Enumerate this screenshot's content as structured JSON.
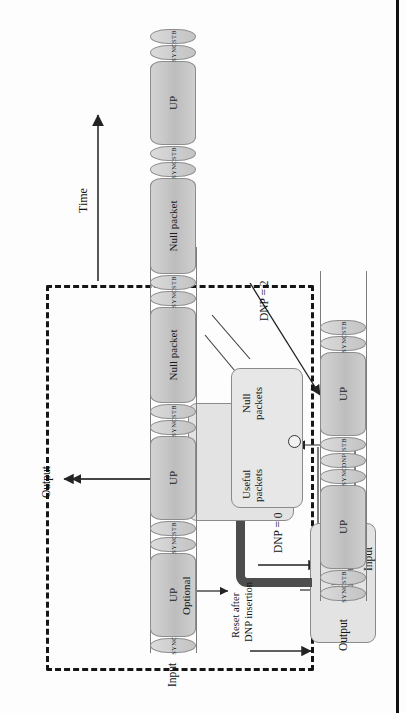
{
  "figure": {
    "type": "block-and-timing-diagram",
    "orientation": "rotated-90-ccw"
  },
  "block_diagram": {
    "container_label": "",
    "counter_box": {
      "line1": "DNP",
      "line2": "counter"
    },
    "insertion_box": {
      "line1": "DNP (1 byte)",
      "line2": "insertion after next",
      "line3": "useful packet"
    },
    "classifier_box": {
      "useful_label_line1": "Useful",
      "useful_label_line2": "packets",
      "null_label_line1": "Null",
      "null_label_line2": "packets"
    },
    "reset_label_line1": "Reset after",
    "reset_label_line2": "DNP insertion",
    "input_label": "Input",
    "output_label": "Output"
  },
  "timing": {
    "time_axis_label": "Time",
    "input_row_label": "Input",
    "output_row_label": "Output",
    "optional_label": "Optional",
    "annotations": [
      {
        "id": "dnp0",
        "text": "DNP = 0"
      },
      {
        "id": "dnp2",
        "text": "DNP = 2"
      }
    ],
    "input_sequence": [
      {
        "kind": "header",
        "text": "SYNC"
      },
      {
        "kind": "packet",
        "text": "UP"
      },
      {
        "kind": "header",
        "text": "SYNC"
      },
      {
        "kind": "header",
        "text": "STB"
      },
      {
        "kind": "packet",
        "text": "UP"
      },
      {
        "kind": "header",
        "text": "SYNC"
      },
      {
        "kind": "header",
        "text": "STB"
      },
      {
        "kind": "packet",
        "text": "Null packet"
      },
      {
        "kind": "header",
        "text": "SYNC"
      },
      {
        "kind": "header",
        "text": "STB"
      },
      {
        "kind": "packet",
        "text": "Null packet"
      },
      {
        "kind": "header",
        "text": "SYNC"
      },
      {
        "kind": "header",
        "text": "STB"
      },
      {
        "kind": "packet",
        "text": "UP"
      },
      {
        "kind": "header",
        "text": "SYNC"
      },
      {
        "kind": "header",
        "text": "STB"
      }
    ],
    "output_sequence": [
      {
        "kind": "header",
        "text": "SYNC"
      },
      {
        "kind": "header",
        "text": "STB"
      },
      {
        "kind": "packet",
        "text": "UP"
      },
      {
        "kind": "header",
        "text": "SYNC"
      },
      {
        "kind": "header",
        "text": "DNP"
      },
      {
        "kind": "header",
        "text": "STB"
      },
      {
        "kind": "packet",
        "text": "UP"
      },
      {
        "kind": "header",
        "text": "SYNC"
      },
      {
        "kind": "header",
        "text": "STB"
      }
    ]
  },
  "colors": {
    "packet_fill": "#c7c7c7",
    "box_fill": "#e3e3e3",
    "pipe": "#4d4d4d",
    "line": "#2b2b2b",
    "dash": "#161616"
  }
}
